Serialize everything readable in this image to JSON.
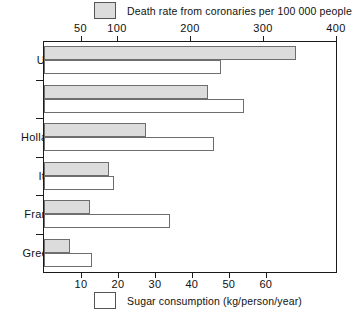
{
  "chart_data": {
    "type": "bar",
    "orientation": "horizontal",
    "title": "",
    "categories": [
      "USA",
      "UK",
      "Holland",
      "Italy",
      "France",
      "Greece"
    ],
    "series": [
      {
        "name": "Death rate from coronaries per 100 000 people",
        "key": "death_rate",
        "axis": "top",
        "fill": "#dcdcdc",
        "values": [
          345,
          224,
          139,
          89,
          63,
          36
        ]
      },
      {
        "name": "Sugar consumption (kg/person/year)",
        "key": "sugar",
        "axis": "bottom",
        "fill": "#ffffff",
        "values": [
          48,
          54,
          46,
          19,
          34,
          13
        ]
      }
    ],
    "top_axis": {
      "label": "Death rate from coronaries per 100 000 people",
      "ticks": [
        50,
        100,
        200,
        300,
        400
      ],
      "tick_labels": [
        "50",
        "100",
        "200",
        "300",
        "400"
      ],
      "min": 0,
      "max": 400,
      "position": "top"
    },
    "bottom_axis": {
      "label": "Sugar consumption (kg/person/year)",
      "ticks": [
        10,
        20,
        30,
        40,
        50,
        60
      ],
      "tick_labels": [
        "10",
        "20",
        "30",
        "40",
        "50",
        "60"
      ],
      "min": 0,
      "max": 79,
      "position": "bottom"
    },
    "ylabel": "",
    "xlabel": "",
    "grid": false,
    "legend_position": "top and bottom, centered"
  },
  "legend": {
    "top": {
      "label": "Death rate from coronaries per 100 000 people",
      "swatch": "filled-gray-square"
    },
    "bottom": {
      "label": "Sugar consumption (kg/person/year)",
      "swatch": "hollow-white-square"
    }
  },
  "colors": {
    "death_bar_fill": "#dcdcdc",
    "sugar_bar_fill": "#ffffff",
    "bar_stroke": "#6e6e6e",
    "axis": "#1a1a1a",
    "text": "#111111",
    "background": "#ffffff"
  }
}
